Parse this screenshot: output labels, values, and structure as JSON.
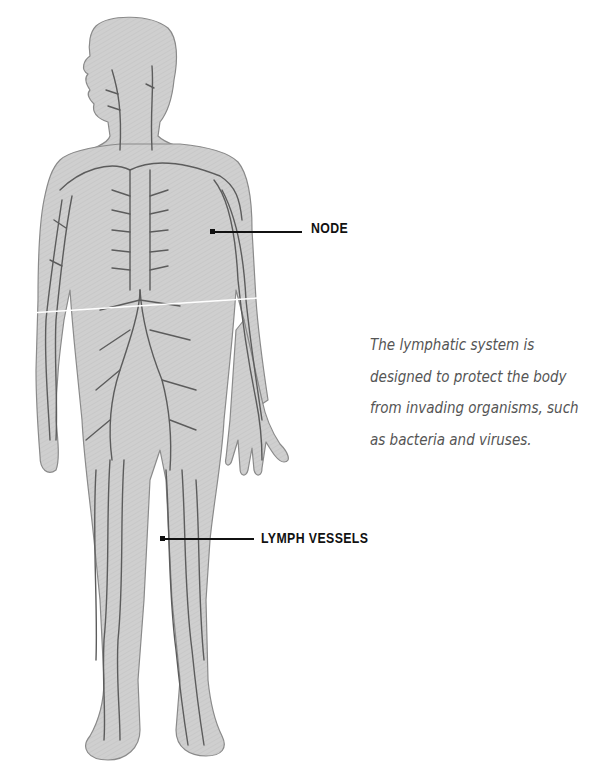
{
  "figure": {
    "colors": {
      "body_fill": "#cfcfcf",
      "body_outline": "#8a8a8a",
      "vessel": "#5c5c5c",
      "label_text": "#111111",
      "caption_text": "#555555",
      "background": "#ffffff"
    }
  },
  "labels": {
    "node": "NODE",
    "lymph_vessels": "LYMPH VESSELS"
  },
  "caption": {
    "lines": [
      "The lymphatic system is",
      "designed to protect the body",
      "from invading organisms, such",
      "as bacteria and viruses."
    ]
  }
}
